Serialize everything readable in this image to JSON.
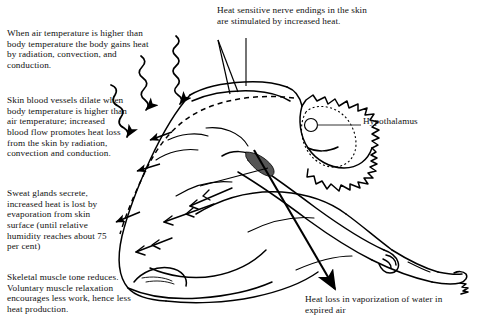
{
  "figure": {
    "type": "anatomical line diagram",
    "background_color": "#ffffff",
    "line_color": "#000000",
    "text_color": "#111111"
  },
  "annotations": {
    "heat_gain": "When air temperature is higher than body temperature the body gains heat by radiation, convection, and conduction.",
    "vasodilation": "Skin blood vessels dilate when body temperature is higher than air temperature; increased blood flow promotes heat loss from the skin by radiation, convection and conduction.",
    "sweating": "Sweat glands secrete, increased heat is lost by evaporation from skin surface (until relative humidity reaches about 75 per cent)",
    "muscle_tone": "Skeletal muscle tone reduces. Voluntary muscle relaxation encourages less work, hence less heat production.",
    "nerve_endings": "Heat sensitive nerve endings in the skin are stimulated by increased heat.",
    "hypothalamus": "Hypothalamus",
    "vaporization": "Heat loss in vaporization of water in expired air"
  },
  "graphics": {
    "wavy_arrows_label": "radiant-heat-wavy-arrows",
    "wavy_arrow_count": 3,
    "dashed_line_label": "dilated-skin-blood-vessel-dashed-line",
    "sweat_arrow_label": "sweat-evaporation-arrows",
    "sweat_arrow_count": 3,
    "big_arrow_label": "expired-air-heat-loss-arrow",
    "hypothalamus_marker": "small-circle-on-brain",
    "brain_outline": "dotted-brain-outline",
    "leader_line_nerve": "nerve-endings-leader-line",
    "leader_line_hypothalamus": "hypothalamus-leader-line"
  }
}
